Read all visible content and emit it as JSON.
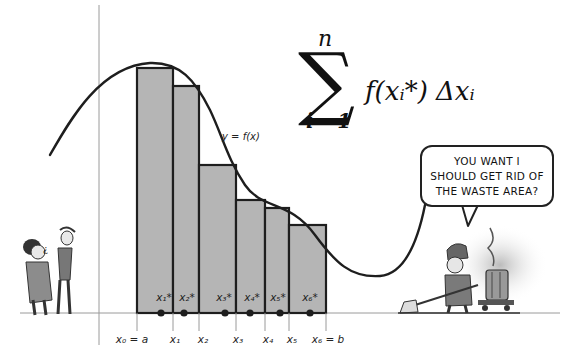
{
  "formula": {
    "upper_limit": "n",
    "lower_limit": "i =1",
    "sigma": "∑",
    "term": "f(xᵢ*) Δxᵢ"
  },
  "curve_label": "y = f(x)",
  "speech_bubble": {
    "lines": [
      "YOU WANT I",
      "SHOULD GET RID OF",
      "THE WASTE AREA?"
    ]
  },
  "axis_labels": [
    {
      "text": "x₀ = a",
      "x": 132
    },
    {
      "text": "x₁",
      "x": 175
    },
    {
      "text": "x₂",
      "x": 203
    },
    {
      "text": "x₃",
      "x": 238
    },
    {
      "text": "x₄",
      "x": 268
    },
    {
      "text": "x₅",
      "x": 292
    },
    {
      "text": "x₆ = b",
      "x": 328
    }
  ],
  "sample_labels": [
    {
      "text": "x₁*",
      "x": 164
    },
    {
      "text": "x₂*",
      "x": 187
    },
    {
      "text": "x₃*",
      "x": 224
    },
    {
      "text": "x₄*",
      "x": 252
    },
    {
      "text": "x₅*",
      "x": 278
    },
    {
      "text": "x₆*",
      "x": 310
    }
  ],
  "rectangles": [
    {
      "x0": 137,
      "x1": 173,
      "top": 68
    },
    {
      "x0": 173,
      "x1": 199,
      "top": 86
    },
    {
      "x0": 199,
      "x1": 236,
      "top": 165
    },
    {
      "x0": 236,
      "x1": 265,
      "top": 200
    },
    {
      "x0": 265,
      "x1": 289,
      "top": 208
    },
    {
      "x0": 289,
      "x1": 326,
      "top": 225
    }
  ],
  "sample_points_x": [
    161,
    184,
    225,
    250,
    280,
    310
  ],
  "colors": {
    "rect_fill": "#b5b5b5",
    "stroke": "#1e1e1e",
    "axis": "#9a9a9a"
  },
  "chart_data": {
    "type": "area",
    "xlabel": "",
    "ylabel": "",
    "curve_label": "y = f(x)",
    "partition_points": [
      "x₀ = a",
      "x₁",
      "x₂",
      "x₃",
      "x₄",
      "x₅",
      "x₆ = b"
    ],
    "sample_points": [
      "x₁*",
      "x₂*",
      "x₃*",
      "x₄*",
      "x₅*",
      "x₆*"
    ],
    "n_rectangles": 6,
    "relative_rect_heights": [
      0.98,
      0.92,
      0.61,
      0.47,
      0.44,
      0.37
    ]
  }
}
